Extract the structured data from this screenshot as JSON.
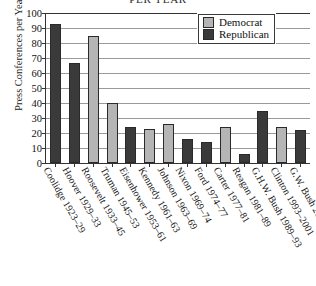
{
  "chart_data": {
    "type": "bar",
    "title": "PER YEAR",
    "xlabel": "",
    "ylabel": "Press Conferences per Year",
    "ylim": [
      0,
      100
    ],
    "yticks": [
      100,
      90,
      80,
      70,
      60,
      50,
      40,
      30,
      20,
      10,
      0
    ],
    "grid": true,
    "legend_position": "top-right",
    "categories": [
      "Coolidge 1923–29",
      "Hoover 1929–33",
      "Roosevelt 1933–45",
      "Truman 1945–53",
      "Eisenhower 1953–61",
      "Kennedy 1961–63",
      "Johnson 1963–69",
      "Nixon 1969–74",
      "Ford 1974–77",
      "Carter 1977–81",
      "Reagan 1981–89",
      "G.H.W. Bush 1989–93",
      "Clinton 1993–2001",
      "G.W. Bush 2001–04"
    ],
    "values": [
      93,
      67,
      85,
      40,
      24,
      23,
      26,
      16,
      14,
      24,
      6,
      35,
      24,
      22
    ],
    "parties": [
      "Republican",
      "Republican",
      "Democrat",
      "Democrat",
      "Republican",
      "Democrat",
      "Democrat",
      "Republican",
      "Republican",
      "Democrat",
      "Republican",
      "Republican",
      "Democrat",
      "Republican"
    ],
    "series": [
      {
        "name": "Democrat",
        "color": "#b5b5b5"
      },
      {
        "name": "Republican",
        "color": "#3a3a3a"
      }
    ]
  },
  "legend": {
    "items": [
      {
        "label": "Democrat",
        "key": "dem"
      },
      {
        "label": "Republican",
        "key": "rep"
      }
    ]
  },
  "colors": {
    "democrat": "#b5b5b5",
    "republican": "#3a3a3a",
    "axis": "#333333",
    "grid": "#9a9a9a",
    "background": "#ffffff"
  }
}
